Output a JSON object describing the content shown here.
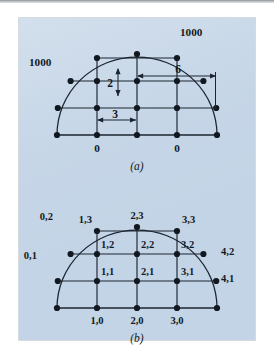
{
  "figure": {
    "background_color": "#c3d4e6",
    "line_color": "#1b2430",
    "node_color": "#111820",
    "page_color": "#ffffff"
  },
  "panel_a": {
    "caption": "(a)",
    "boundary_labels": [
      {
        "id": "bc-left-1000",
        "text": "1000",
        "x": 26,
        "y": 62
      },
      {
        "id": "bc-right-1000",
        "text": "1000",
        "x": 182,
        "y": 32
      },
      {
        "id": "bc-bottom-0-left",
        "text": "0",
        "x": 88,
        "y": 143
      },
      {
        "id": "bc-bottom-0-right",
        "text": "0",
        "x": 168,
        "y": 143
      }
    ],
    "dimensions": [
      {
        "id": "dim-vertical-2",
        "text": "2",
        "x": 110,
        "y": 84,
        "orientation": "vertical"
      },
      {
        "id": "dim-horizontal-3",
        "text": "3",
        "x": 90,
        "y": 117,
        "orientation": "horizontal"
      },
      {
        "id": "dim-horizontal-6",
        "text": "6",
        "x": 177,
        "y": 73,
        "orientation": "horizontal"
      }
    ]
  },
  "panel_b": {
    "caption": "(b)",
    "node_labels": [
      {
        "id": "node-0-1",
        "text": "0,1",
        "x": 22,
        "y": 258
      },
      {
        "id": "node-0-2",
        "text": "0,2",
        "x": 40,
        "y": 218
      },
      {
        "id": "node-1-0",
        "text": "1,0",
        "x": 68,
        "y": 320
      },
      {
        "id": "node-1-1",
        "text": "1,1",
        "x": 79,
        "y": 272
      },
      {
        "id": "node-1-2",
        "text": "1,2",
        "x": 79,
        "y": 231
      },
      {
        "id": "node-1-3",
        "text": "1,3",
        "x": 67,
        "y": 196
      },
      {
        "id": "node-2-0",
        "text": "2,0",
        "x": 108,
        "y": 320
      },
      {
        "id": "node-2-1",
        "text": "2,1",
        "x": 119,
        "y": 272
      },
      {
        "id": "node-2-2",
        "text": "2,2",
        "x": 119,
        "y": 231
      },
      {
        "id": "node-2-3",
        "text": "2,3",
        "x": 110,
        "y": 189
      },
      {
        "id": "node-3-0",
        "text": "3,0",
        "x": 148,
        "y": 320
      },
      {
        "id": "node-3-1",
        "text": "3,1",
        "x": 159,
        "y": 272
      },
      {
        "id": "node-3-2",
        "text": "3,2",
        "x": 159,
        "y": 231
      },
      {
        "id": "node-3-3",
        "text": "3,3",
        "x": 151,
        "y": 196
      },
      {
        "id": "node-4-1",
        "text": "4,1",
        "x": 201,
        "y": 251
      },
      {
        "id": "node-4-2",
        "text": "4,2",
        "x": 196,
        "y": 214
      }
    ]
  },
  "geometry": {
    "panel_a": {
      "center_x": 137,
      "baseline_y": 135,
      "radius_x": 80,
      "radius_y": 78,
      "col_x": [
        57,
        97,
        137,
        177,
        217
      ],
      "row_y": [
        135,
        108,
        81,
        54
      ],
      "grid_nodes": [
        {
          "c": 0,
          "r": 0
        },
        {
          "c": 1,
          "r": 0
        },
        {
          "c": 2,
          "r": 0
        },
        {
          "c": 3,
          "r": 0
        },
        {
          "c": 4,
          "r": 0
        },
        {
          "c": 1,
          "r": 1
        },
        {
          "c": 2,
          "r": 1
        },
        {
          "c": 3,
          "r": 1
        },
        {
          "c": 1,
          "r": 2
        },
        {
          "c": 2,
          "r": 2
        },
        {
          "c": 3,
          "r": 2
        },
        {
          "c": 2,
          "r": 3
        }
      ],
      "boundary_nodes": [
        {
          "x": 57.8,
          "y": 108
        },
        {
          "x": 216.2,
          "y": 108
        },
        {
          "x": 70.6,
          "y": 81
        },
        {
          "x": 203.4,
          "y": 81
        },
        {
          "x": 97,
          "y": 58
        },
        {
          "x": 177,
          "y": 58
        }
      ]
    },
    "panel_b": {
      "center_x": 137,
      "baseline_y": 308,
      "radius_x": 80,
      "radius_y": 78,
      "col_x": [
        57,
        97,
        137,
        177,
        217
      ],
      "row_y": [
        308,
        281,
        254,
        227
      ],
      "grid_nodes": [
        {
          "c": 0,
          "r": 0
        },
        {
          "c": 1,
          "r": 0
        },
        {
          "c": 2,
          "r": 0
        },
        {
          "c": 3,
          "r": 0
        },
        {
          "c": 4,
          "r": 0
        },
        {
          "c": 1,
          "r": 1
        },
        {
          "c": 2,
          "r": 1
        },
        {
          "c": 3,
          "r": 1
        },
        {
          "c": 1,
          "r": 2
        },
        {
          "c": 2,
          "r": 2
        },
        {
          "c": 3,
          "r": 2
        },
        {
          "c": 2,
          "r": 3
        }
      ],
      "boundary_nodes": [
        {
          "x": 57.8,
          "y": 281
        },
        {
          "x": 216.2,
          "y": 281
        },
        {
          "x": 70.6,
          "y": 254
        },
        {
          "x": 203.4,
          "y": 254
        },
        {
          "x": 97,
          "y": 231
        },
        {
          "x": 177,
          "y": 231
        }
      ]
    }
  }
}
